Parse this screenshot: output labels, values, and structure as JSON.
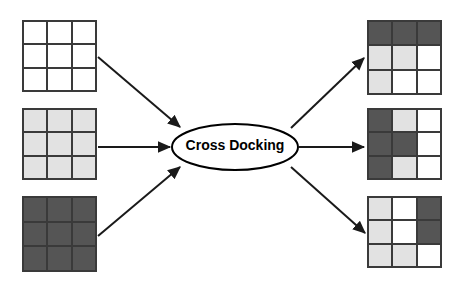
{
  "diagram": {
    "title": "Cross Docking",
    "hub": {
      "label": "Cross Docking",
      "font_size": 14,
      "cx": 235,
      "cy": 147,
      "rx": 63,
      "ry": 23,
      "fill": "#ffffff",
      "stroke": "#000000"
    },
    "palette": {
      "white": "#ffffff",
      "light": "#e2e2e2",
      "dark": "#555555",
      "border": "#3a3a3a",
      "arrow": "#1a1a1a",
      "background": "#ffffff"
    },
    "inbound_grids": [
      {
        "name": "inbound-grid-1",
        "x": 22,
        "y": 20,
        "w": 75,
        "h": 72,
        "cells": [
          [
            "white",
            "white",
            "white"
          ],
          [
            "white",
            "white",
            "white"
          ],
          [
            "white",
            "white",
            "white"
          ]
        ]
      },
      {
        "name": "inbound-grid-2",
        "x": 22,
        "y": 108,
        "w": 75,
        "h": 72,
        "cells": [
          [
            "light",
            "light",
            "light"
          ],
          [
            "light",
            "light",
            "light"
          ],
          [
            "light",
            "light",
            "light"
          ]
        ]
      },
      {
        "name": "inbound-grid-3",
        "x": 22,
        "y": 196,
        "w": 75,
        "h": 76,
        "cells": [
          [
            "dark",
            "dark",
            "dark"
          ],
          [
            "dark",
            "dark",
            "dark"
          ],
          [
            "dark",
            "dark",
            "dark"
          ]
        ]
      }
    ],
    "outbound_grids": [
      {
        "name": "outbound-grid-1",
        "x": 367,
        "y": 20,
        "w": 75,
        "h": 75,
        "cells": [
          [
            "dark",
            "dark",
            "dark"
          ],
          [
            "light",
            "light",
            "white"
          ],
          [
            "light",
            "white",
            "white"
          ]
        ]
      },
      {
        "name": "outbound-grid-2",
        "x": 367,
        "y": 108,
        "w": 75,
        "h": 72,
        "cells": [
          [
            "dark",
            "light",
            "white"
          ],
          [
            "dark",
            "dark",
            "white"
          ],
          [
            "dark",
            "light",
            "white"
          ]
        ]
      },
      {
        "name": "outbound-grid-3",
        "x": 367,
        "y": 196,
        "w": 75,
        "h": 72,
        "cells": [
          [
            "light",
            "white",
            "dark"
          ],
          [
            "light",
            "white",
            "dark"
          ],
          [
            "light",
            "light",
            "white"
          ]
        ]
      }
    ],
    "arrows": [
      {
        "name": "arrow-inbound-1",
        "x1": 98,
        "y1": 57,
        "x2": 180,
        "y2": 127
      },
      {
        "name": "arrow-inbound-2",
        "x1": 98,
        "y1": 147,
        "x2": 170,
        "y2": 147
      },
      {
        "name": "arrow-inbound-3",
        "x1": 98,
        "y1": 236,
        "x2": 180,
        "y2": 167
      },
      {
        "name": "arrow-outbound-1",
        "x1": 291,
        "y1": 128,
        "x2": 364,
        "y2": 58
      },
      {
        "name": "arrow-outbound-2",
        "x1": 299,
        "y1": 147,
        "x2": 364,
        "y2": 147
      },
      {
        "name": "arrow-outbound-3",
        "x1": 291,
        "y1": 167,
        "x2": 365,
        "y2": 233
      }
    ]
  }
}
